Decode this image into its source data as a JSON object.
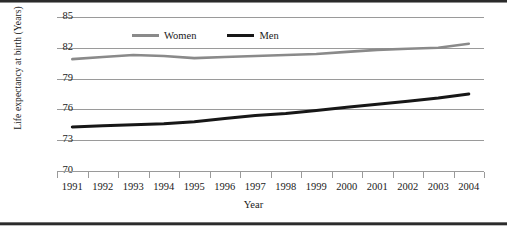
{
  "chart_data": {
    "type": "line",
    "title": "",
    "subtitle": "",
    "xlabel": "Year",
    "ylabel": "Life expectancy at birth (Years)",
    "x": [
      1991,
      1992,
      1993,
      1994,
      1995,
      1996,
      1997,
      1998,
      1999,
      2000,
      2001,
      2002,
      2003,
      2004
    ],
    "xtick_labels": [
      "1991",
      "1992",
      "1993",
      "1994",
      "1995",
      "1996",
      "1997",
      "1998",
      "1999",
      "2000",
      "2001",
      "2002",
      "2003",
      "2004"
    ],
    "ytick_labels": [
      "85",
      "82",
      "79",
      "76",
      "73",
      "70"
    ],
    "yticks": [
      85,
      82,
      79,
      76,
      73,
      70
    ],
    "xlim": [
      1990.5,
      2004.5
    ],
    "ylim": [
      70,
      85
    ],
    "grid": true,
    "legend_position": "top-center",
    "series": [
      {
        "name": "Women",
        "color": "#8a8a8a",
        "values": [
          80.9,
          81.1,
          81.3,
          81.2,
          81.0,
          81.1,
          81.2,
          81.3,
          81.4,
          81.6,
          81.8,
          81.9,
          82.0,
          82.4
        ]
      },
      {
        "name": "Men",
        "color": "#171717",
        "values": [
          74.3,
          74.4,
          74.5,
          74.6,
          74.8,
          75.1,
          75.4,
          75.6,
          75.9,
          76.2,
          76.5,
          76.8,
          77.1,
          77.5
        ]
      }
    ]
  },
  "legend": {
    "items": [
      {
        "label": "Women",
        "swatch": "line-swatch-gray"
      },
      {
        "label": "Men",
        "swatch": "line-swatch-black"
      }
    ]
  },
  "axes": {
    "y_title": "Life expectancy at birth (Years)",
    "x_title": "Year"
  },
  "colors": {
    "women": "#8a8a8a",
    "men": "#171717",
    "grid": "#9a9a9a",
    "text": "#1a1a1a",
    "rule": "#2b2b2b"
  }
}
